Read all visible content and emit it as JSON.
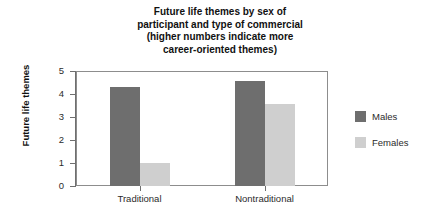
{
  "chart_data": {
    "type": "bar",
    "title": "Future life themes by sex of\nparticipant and type of commercial\n(higher numbers indicate more\ncareer-oriented themes)",
    "xlabel": "",
    "ylabel": "Future life themes",
    "ylim": [
      0,
      5
    ],
    "yticks": [
      "0",
      "1",
      "2",
      "3",
      "4",
      "5"
    ],
    "grid": false,
    "legend_position": "right",
    "categories": [
      "Traditional",
      "Nontraditional"
    ],
    "series": [
      {
        "name": "Males",
        "color": "#6e6e6e",
        "values": [
          4.35,
          4.6
        ]
      },
      {
        "name": "Females",
        "color": "#cfcfcf",
        "values": [
          1.05,
          3.6
        ]
      }
    ]
  }
}
